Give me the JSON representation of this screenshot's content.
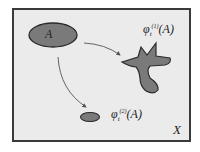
{
  "diagram": {
    "space_label": "X",
    "set_label": "A",
    "images": [
      {
        "symbol": "φ",
        "subscript": "t",
        "superscript": "(1)",
        "argument": "(A)",
        "shape": "irregular branched blob"
      },
      {
        "symbol": "φ",
        "subscript": "t",
        "superscript": "(2)",
        "argument": "(A)",
        "shape": "small ellipse"
      }
    ],
    "arrows": [
      {
        "from": "A",
        "to": "φt(1)(A)"
      },
      {
        "from": "A",
        "to": "φt(2)(A)"
      }
    ],
    "colors": {
      "background": "#ebebeb",
      "border": "#3a3a3a",
      "shape_fill": "#7a7a7a",
      "shape_stroke": "#2a2a2a",
      "arrow": "#555555"
    }
  }
}
